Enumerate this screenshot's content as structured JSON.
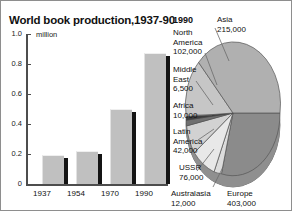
{
  "figure": {
    "background": "#ffffff",
    "border_color": "#8e8e8e"
  },
  "bar_chart": {
    "title": "World book production,1937-90",
    "unit": "million",
    "axis_color": "#4d4d4d",
    "bar_color": "#c0c0c0",
    "bar_shadow_color": "#141414"
  },
  "pie_chart": {
    "year": "1990",
    "labels": {
      "asia": {
        "name": "Asia",
        "value": "215,000"
      },
      "north_america": {
        "name_line1": "North",
        "name_line2": "America",
        "value": "102,000"
      },
      "middle_east": {
        "name_line1": "Middle",
        "name_line2": "East",
        "value": "6,500"
      },
      "africa": {
        "name": "Africa",
        "value": "10,000"
      },
      "latin_america": {
        "name_line1": "Latin",
        "name_line2": "America",
        "value": "42,000"
      },
      "ussr": {
        "name": "USSR",
        "value": "76,000"
      },
      "australasia": {
        "name": "Australasia",
        "value": "12,000"
      },
      "europe": {
        "name": "Europe",
        "value": "403,000"
      }
    }
  },
  "chart_data": [
    {
      "type": "bar",
      "title": "World book production,1937-90",
      "xlabel": "",
      "ylabel": "million",
      "ylim": [
        0,
        1.0
      ],
      "ytick_labels": [
        "1.0",
        "0.8",
        "0.6",
        "0.4",
        "0.2",
        "0"
      ],
      "yticks": [
        1.0,
        0.8,
        0.6,
        0.4,
        0.2,
        0
      ],
      "grid": false,
      "legend": "none",
      "categories": [
        "1937",
        "1954",
        "1970",
        "1990"
      ],
      "values": [
        0.19,
        0.22,
        0.5,
        0.87
      ],
      "annotations": [
        "million"
      ]
    },
    {
      "type": "pie",
      "title": "1990",
      "ylabel": "",
      "xlabel": "",
      "legend": "labels-around-pie",
      "categories": [
        "Asia",
        "North America",
        "Middle East",
        "Africa",
        "Latin America",
        "USSR",
        "Australasia",
        "Europe"
      ],
      "values": [
        215000,
        102000,
        6500,
        10000,
        42000,
        76000,
        12000,
        403000
      ],
      "value_labels": [
        "215,000",
        "102,000",
        "6,500",
        "10,000",
        "42,000",
        "76,000",
        "12,000",
        "403,000"
      ]
    }
  ]
}
